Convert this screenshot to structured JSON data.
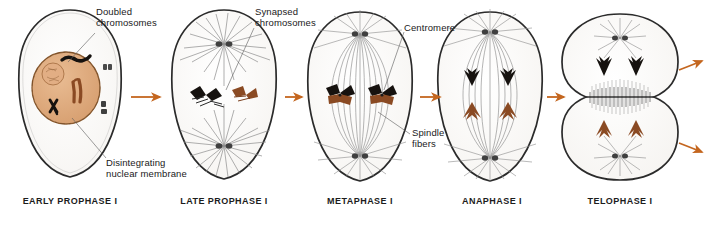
{
  "figure": {
    "background_color": "#ffffff",
    "arrow_color": "#c4661f",
    "ink_color": "#1a1a1a",
    "nucleus_fill": "#dfa87a",
    "nucleus_stroke": "#9a6234",
    "chromosome_black": "#16120f",
    "chromosome_brown": "#8a4a23",
    "centriole_color": "#4a4a4a",
    "cell_fill": "#fdfdfc",
    "cell_stroke": "#2b2b2b",
    "spindle_color": "#8c8c8c"
  },
  "phases": [
    {
      "id": "early-prophase-i",
      "label": "EARLY PROPHASE I",
      "cx": 70,
      "label_x": 70
    },
    {
      "id": "late-prophase-i",
      "label": "LATE PROPHASE I",
      "cx": 224,
      "label_x": 224
    },
    {
      "id": "metaphase-i",
      "label": "METAPHASE I",
      "cx": 360,
      "label_x": 360
    },
    {
      "id": "anaphase-i",
      "label": "ANAPHASE I",
      "cx": 490,
      "label_x": 492
    },
    {
      "id": "telophase-i",
      "label": "TELOPHASE I",
      "cx": 620,
      "label_x": 620
    }
  ],
  "annotations": [
    {
      "id": "doubled-chromosomes",
      "text": "Doubled\nchromosomes",
      "x": 96,
      "y": 8
    },
    {
      "id": "synapsed-chromosomes",
      "text": "Synapsed\nchromosomes",
      "x": 255,
      "y": 8
    },
    {
      "id": "centromere",
      "text": "Centromere",
      "x": 404,
      "y": 25
    },
    {
      "id": "spindle-fibers",
      "text": "Spindle\nfibers",
      "x": 412,
      "y": 130
    },
    {
      "id": "disintegrating-nuclear-membrane",
      "text": "Disintegrating\nnuclear membrane",
      "x": 108,
      "y": 160
    }
  ],
  "arrows": [
    {
      "id": "arrow-early-to-late",
      "x1": 130,
      "y1": 97,
      "x2": 163,
      "y2": 97
    },
    {
      "id": "arrow-late-to-metaphase",
      "x1": 288,
      "y1": 97,
      "x2": 300,
      "y2": 97
    },
    {
      "id": "arrow-metaphase-to-anaphase",
      "x1": 421,
      "y1": 97,
      "x2": 443,
      "y2": 97
    },
    {
      "id": "arrow-anaphase-to-telophase",
      "x1": 548,
      "y1": 97,
      "x2": 566,
      "y2": 97
    },
    {
      "id": "arrow-telophase-out-top",
      "x1": 679,
      "y1": 70,
      "x2": 704,
      "y2": 60
    },
    {
      "id": "arrow-telophase-out-bottom",
      "x1": 679,
      "y1": 143,
      "x2": 704,
      "y2": 153
    }
  ]
}
